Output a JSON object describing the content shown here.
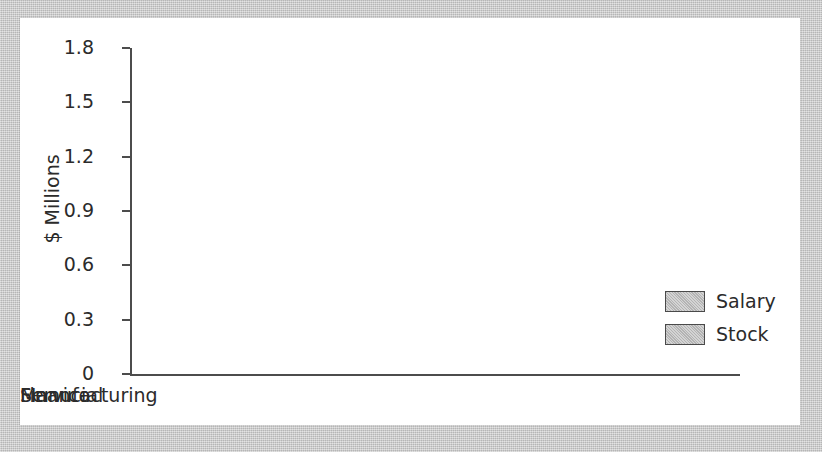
{
  "chart_data": {
    "type": "bar",
    "title": "",
    "xlabel": "",
    "ylabel": "$ Millions",
    "categories": [
      "Manufacturing",
      "Financial",
      "Service"
    ],
    "series": [
      {
        "name": "Salary",
        "values": [
          1.12,
          1.26,
          1.23
        ]
      },
      {
        "name": "Stock",
        "values": [
          1.6,
          1.01,
          1.35
        ]
      }
    ],
    "ylim": [
      0,
      1.8
    ],
    "ytick_labels": [
      "1.8",
      "1.5",
      "1.2",
      "0.9",
      "0.6",
      "0.3",
      "0"
    ],
    "ytick_values": [
      1.8,
      1.5,
      1.2,
      0.9,
      0.6,
      0.3,
      0
    ],
    "grid": false,
    "legend_position": "right",
    "legend_entries": [
      "Salary",
      "Stock"
    ],
    "style": "3d-grouped-bar",
    "colors": {
      "bar_face": "#bdbdbd",
      "bar_side": "#4f4f4f",
      "bar_top": "#9a9a9a",
      "bar_outline": "#4a4a4a",
      "axis": "#4c4c4c",
      "text": "#2b2b2b",
      "plot_background": "#ffffff",
      "page_background": "#c9c9c9"
    }
  },
  "axis": {
    "y_title": "$ Millions",
    "ticks": [
      "1.8",
      "1.5",
      "1.2",
      "0.9",
      "0.6",
      "0.3",
      "0"
    ]
  },
  "categories": [
    {
      "label": "Manufacturing"
    },
    {
      "label": "Financial"
    },
    {
      "label": "Service"
    }
  ],
  "legend": {
    "items": [
      {
        "label": "Salary"
      },
      {
        "label": "Stock"
      }
    ]
  }
}
